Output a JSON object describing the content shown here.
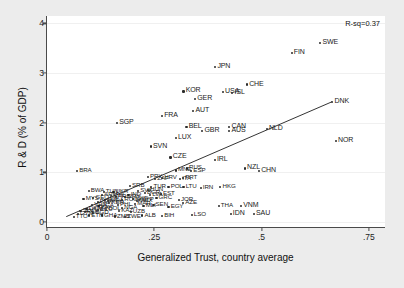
{
  "chart_data": {
    "type": "scatter",
    "title": "",
    "xlabel": "Generalized Trust, country average",
    "ylabel": "R & D (% of GDP)",
    "xlim": [
      0,
      0.79
    ],
    "ylim": [
      -0.12,
      4.15
    ],
    "xticks": [
      "0",
      ".25",
      ".5",
      ".75"
    ],
    "xtickvals": [
      0,
      0.25,
      0.5,
      0.75
    ],
    "yticks": [
      "0",
      "1",
      "2",
      "3",
      "4"
    ],
    "ytickvals": [
      0,
      1,
      2,
      3,
      4
    ],
    "grid": true,
    "legend": "none",
    "annotation": "R-sq=0.37",
    "fit_line": {
      "x0": 0.045,
      "y0": 0.09,
      "x1": 0.665,
      "y1": 2.41
    },
    "points": [
      {
        "label": "SWE",
        "x": 0.637,
        "y": 3.6
      },
      {
        "label": "FIN",
        "x": 0.57,
        "y": 3.4
      },
      {
        "label": "JPN",
        "x": 0.392,
        "y": 3.12
      },
      {
        "label": "CHE",
        "x": 0.466,
        "y": 2.77
      },
      {
        "label": "KOR",
        "x": 0.318,
        "y": 2.63
      },
      {
        "label": "USA",
        "x": 0.41,
        "y": 2.62
      },
      {
        "label": "ISL",
        "x": 0.432,
        "y": 2.6
      },
      {
        "label": "GER",
        "x": 0.345,
        "y": 2.48
      },
      {
        "label": "DNK",
        "x": 0.665,
        "y": 2.41
      },
      {
        "label": "AUT",
        "x": 0.341,
        "y": 2.23
      },
      {
        "label": "FRA",
        "x": 0.268,
        "y": 2.14
      },
      {
        "label": "SGP",
        "x": 0.163,
        "y": 1.99
      },
      {
        "label": "BEL",
        "x": 0.325,
        "y": 1.91
      },
      {
        "label": "CAN",
        "x": 0.425,
        "y": 1.92
      },
      {
        "label": "AUS",
        "x": 0.425,
        "y": 1.83
      },
      {
        "label": "NLD",
        "x": 0.512,
        "y": 1.87
      },
      {
        "label": "GBR",
        "x": 0.362,
        "y": 1.83
      },
      {
        "label": "LUX",
        "x": 0.3,
        "y": 1.69
      },
      {
        "label": "NOR",
        "x": 0.673,
        "y": 1.64
      },
      {
        "label": "SVN",
        "x": 0.242,
        "y": 1.52
      },
      {
        "label": "CZE",
        "x": 0.288,
        "y": 1.3
      },
      {
        "label": "IRL",
        "x": 0.391,
        "y": 1.25
      },
      {
        "label": "NZL",
        "x": 0.461,
        "y": 1.08
      },
      {
        "label": "CHN",
        "x": 0.494,
        "y": 1.03
      },
      {
        "label": "BRA",
        "x": 0.07,
        "y": 1.02
      },
      {
        "label": "RUS",
        "x": 0.326,
        "y": 1.08
      },
      {
        "label": "ESP",
        "x": 0.336,
        "y": 1.02
      },
      {
        "label": "MNE",
        "x": 0.3,
        "y": 1.04
      },
      {
        "label": "HRV",
        "x": 0.268,
        "y": 0.88
      },
      {
        "label": "PRT",
        "x": 0.317,
        "y": 0.88
      },
      {
        "label": "PRY",
        "x": 0.235,
        "y": 0.9
      },
      {
        "label": "ZAF",
        "x": 0.252,
        "y": 0.86
      },
      {
        "label": "ITA",
        "x": 0.31,
        "y": 0.86
      },
      {
        "label": "HKG",
        "x": 0.404,
        "y": 0.7
      },
      {
        "label": "POL",
        "x": 0.283,
        "y": 0.71
      },
      {
        "label": "IRN",
        "x": 0.358,
        "y": 0.69
      },
      {
        "label": "LTU",
        "x": 0.318,
        "y": 0.7
      },
      {
        "label": "SRB",
        "x": 0.193,
        "y": 0.73
      },
      {
        "label": "TUR",
        "x": 0.243,
        "y": 0.71
      },
      {
        "label": "BWA",
        "x": 0.097,
        "y": 0.63
      },
      {
        "label": "THA",
        "x": 0.4,
        "y": 0.33
      },
      {
        "label": "VNM",
        "x": 0.452,
        "y": 0.33
      },
      {
        "label": "IDN",
        "x": 0.428,
        "y": 0.16
      },
      {
        "label": "SAU",
        "x": 0.482,
        "y": 0.16
      },
      {
        "label": "LSO",
        "x": 0.337,
        "y": 0.14
      },
      {
        "label": "BIH",
        "x": 0.268,
        "y": 0.12
      },
      {
        "label": "AZE",
        "x": 0.317,
        "y": 0.38
      },
      {
        "label": "JOR",
        "x": 0.307,
        "y": 0.44
      },
      {
        "label": "EGY",
        "x": 0.283,
        "y": 0.3
      },
      {
        "label": "ALB",
        "x": 0.222,
        "y": 0.13
      },
      {
        "label": "ZWE",
        "x": 0.182,
        "y": 0.1
      },
      {
        "label": "GHA",
        "x": 0.128,
        "y": 0.13
      },
      {
        "label": "ETH",
        "x": 0.098,
        "y": 0.13
      },
      {
        "label": "UGA",
        "x": 0.12,
        "y": 0.32
      },
      {
        "label": "MEX",
        "x": 0.21,
        "y": 0.43
      },
      {
        "label": "ARG",
        "x": 0.16,
        "y": 0.5
      },
      {
        "label": "IND",
        "x": 0.19,
        "y": 0.55
      },
      {
        "label": "CHL",
        "x": 0.15,
        "y": 0.52
      },
      {
        "label": "COL",
        "x": 0.135,
        "y": 0.45
      },
      {
        "label": "PER",
        "x": 0.118,
        "y": 0.4
      },
      {
        "label": "PHL",
        "x": 0.165,
        "y": 0.35
      },
      {
        "label": "MAR",
        "x": 0.205,
        "y": 0.37
      },
      {
        "label": "KEN",
        "x": 0.145,
        "y": 0.38
      },
      {
        "label": "NGA",
        "x": 0.175,
        "y": 0.28
      },
      {
        "label": "TZA",
        "x": 0.112,
        "y": 0.28
      },
      {
        "label": "MLI",
        "x": 0.225,
        "y": 0.33
      },
      {
        "label": "SEN",
        "x": 0.248,
        "y": 0.34
      },
      {
        "label": "BGR",
        "x": 0.228,
        "y": 0.58
      },
      {
        "label": "SVK",
        "x": 0.212,
        "y": 0.62
      },
      {
        "label": "EST",
        "x": 0.265,
        "y": 0.56
      },
      {
        "label": "LVA",
        "x": 0.24,
        "y": 0.55
      },
      {
        "label": "MKD",
        "x": 0.2,
        "y": 0.47
      },
      {
        "label": "GRC",
        "x": 0.255,
        "y": 0.48
      },
      {
        "label": "ROU",
        "x": 0.175,
        "y": 0.44
      },
      {
        "label": "UKR",
        "x": 0.155,
        "y": 0.6
      },
      {
        "label": "ARM",
        "x": 0.128,
        "y": 0.55
      },
      {
        "label": "GEO",
        "x": 0.108,
        "y": 0.48
      },
      {
        "label": "MDA",
        "x": 0.142,
        "y": 0.42
      },
      {
        "label": "KAZ",
        "x": 0.168,
        "y": 0.22
      },
      {
        "label": "UZB",
        "x": 0.195,
        "y": 0.2
      },
      {
        "label": "PAK",
        "x": 0.088,
        "y": 0.21
      },
      {
        "label": "BGD",
        "x": 0.108,
        "y": 0.19
      },
      {
        "label": "TTO",
        "x": 0.062,
        "y": 0.1
      },
      {
        "label": "CYP",
        "x": 0.215,
        "y": 0.45
      },
      {
        "label": "MYS",
        "x": 0.085,
        "y": 0.46
      },
      {
        "label": "TUN",
        "x": 0.132,
        "y": 0.6
      },
      {
        "label": "VEN",
        "x": 0.105,
        "y": 0.34
      },
      {
        "label": "DOM",
        "x": 0.092,
        "y": 0.27
      },
      {
        "label": "SLV",
        "x": 0.078,
        "y": 0.23
      },
      {
        "label": "GTM",
        "x": 0.072,
        "y": 0.16
      },
      {
        "label": "ECU",
        "x": 0.118,
        "y": 0.24
      },
      {
        "label": "BOL",
        "x": 0.138,
        "y": 0.26
      },
      {
        "label": "URY",
        "x": 0.182,
        "y": 0.51
      },
      {
        "label": "HUN",
        "x": 0.235,
        "y": 0.64
      },
      {
        "label": "ZMB",
        "x": 0.158,
        "y": 0.11
      }
    ]
  }
}
